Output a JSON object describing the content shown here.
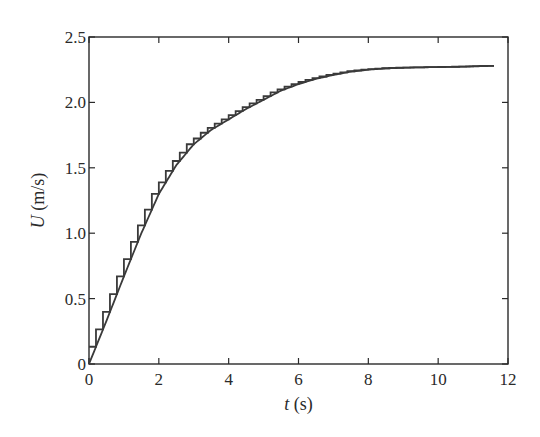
{
  "chart_data": {
    "type": "line",
    "title": "",
    "xlabel_var": "t",
    "xlabel_unit": " (s)",
    "ylabel_var": "U",
    "ylabel_unit": " (m/s)",
    "xlim": [
      0,
      12
    ],
    "ylim": [
      0,
      2.5
    ],
    "grid": false,
    "legend": "none",
    "x_ticks": [
      0,
      2,
      4,
      6,
      8,
      10,
      12
    ],
    "x_tick_labels": [
      "0",
      "2",
      "4",
      "6",
      "8",
      "10",
      "12"
    ],
    "y_ticks": [
      0,
      0.5,
      1.0,
      1.5,
      2.0,
      2.5
    ],
    "y_tick_labels": [
      "0",
      "0.5",
      "1.0",
      "1.5",
      "2.0",
      "2.5"
    ],
    "series": [
      {
        "name": "continuous",
        "style": "smooth",
        "x": [
          0,
          0.5,
          1,
          1.5,
          2,
          2.5,
          3,
          3.5,
          4,
          4.5,
          5,
          5.5,
          6,
          6.5,
          7,
          7.5,
          8,
          8.5,
          9,
          9.5,
          10,
          10.5,
          11,
          11.6
        ],
        "y": [
          0,
          0.33,
          0.67,
          1.0,
          1.3,
          1.52,
          1.68,
          1.79,
          1.87,
          1.95,
          2.02,
          2.09,
          2.14,
          2.18,
          2.21,
          2.235,
          2.25,
          2.26,
          2.265,
          2.268,
          2.27,
          2.272,
          2.275,
          2.28
        ]
      },
      {
        "name": "sampled (zero-order hold)",
        "style": "staircase",
        "sample_period": 0.2
      }
    ],
    "colors": {
      "line": "#3a3a3a",
      "axis": "#2a2a2a"
    }
  }
}
